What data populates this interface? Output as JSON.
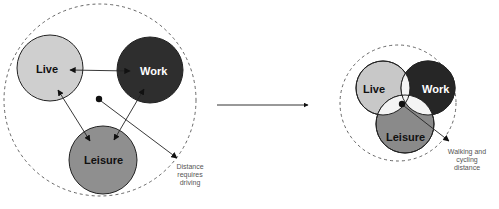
{
  "left_diagram": {
    "title": "Separated uses",
    "circles": {
      "live": {
        "label": "Live",
        "fill": "#cfcfcf"
      },
      "work": {
        "label": "Work",
        "fill": "#2e2e2e"
      },
      "leisure": {
        "label": "Leisure",
        "fill": "#8f8f8f"
      }
    },
    "note_lines": [
      "Distance",
      "requires",
      "driving"
    ]
  },
  "transition_arrow": {
    "direction": "right"
  },
  "right_diagram": {
    "title": "Mixed uses",
    "circles": {
      "live": {
        "label": "Live",
        "fill": "#c8c8c8"
      },
      "work": {
        "label": "Work",
        "fill": "#262626"
      },
      "leisure": {
        "label": "Leisure",
        "fill": "#8a8a8a"
      }
    },
    "overlap_fill": "#f4f4f4",
    "note_lines": [
      "Walking and",
      "cycling",
      "distance"
    ]
  },
  "colors": {
    "stroke": "#222222",
    "dashed": "#555555",
    "note_text": "#555555"
  }
}
